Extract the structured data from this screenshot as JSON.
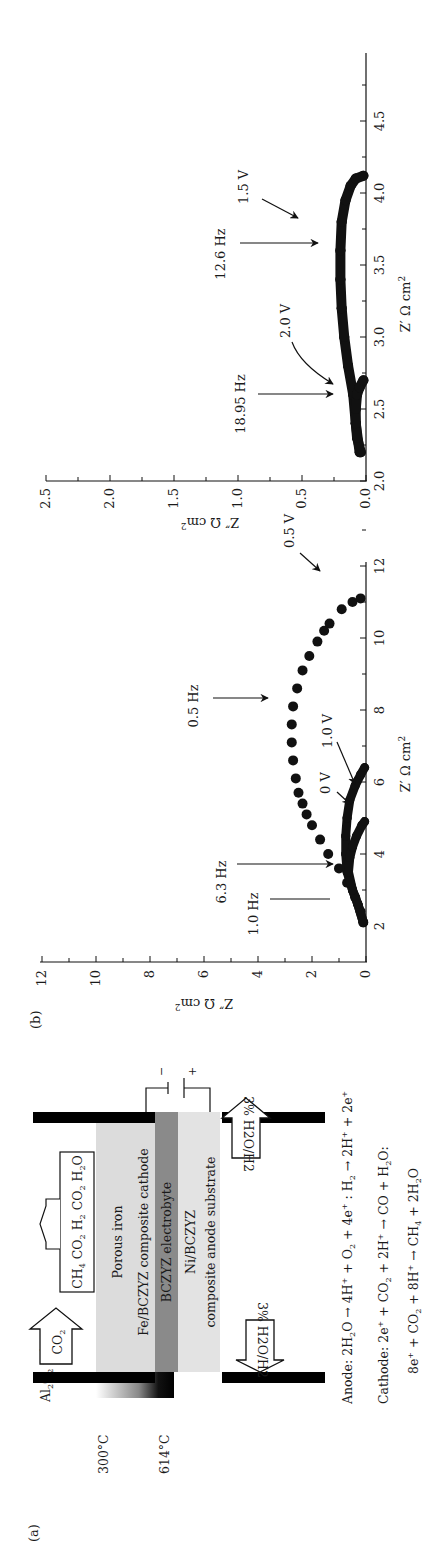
{
  "figure": {
    "panel_a": {
      "label": "(a)",
      "temperatures": {
        "low": "300°C",
        "high": "614°C"
      },
      "tube_label": "Al2O2 tube",
      "layers": {
        "cathode_line1": "Porous iron",
        "cathode_line2": "Fe/BCZYZ composite cathode",
        "electrolyte": "BCZYZ electrobyte",
        "anode_line1": "Ni/BCZYZ",
        "anode_line2": "composite anode substrate"
      },
      "gas_in_cathode": "CO2",
      "gas_out_cathode": "CH4 CO2 H2 CO2 H2O",
      "gas_in_anode": "3% H2O/H2",
      "gas_out_anode": "3% H2O/H2",
      "power_source": {
        "negative": "−",
        "positive": "+"
      },
      "equations": {
        "anode": "Anode: 2H2O → 4H+ + O2 + 4e+ : H2 → 2H+ + 2e+",
        "cathode_1": "Cathode: 2e+ + CO2 + 2H+ → CO + H2O:",
        "cathode_2": "8e+ + CO2 + 8H+ → CH4 + 2H2O"
      }
    },
    "panel_b": {
      "label": "(b)"
    }
  },
  "chart_data": [
    {
      "type": "scatter",
      "title": "(b) left — Nyquist plot, low voltages",
      "xlabel": "Z′ Ω cm²",
      "ylabel": "Z″ Ω cm²",
      "xlim": [
        1,
        13
      ],
      "ylim": [
        0,
        12
      ],
      "xticks": [
        "2",
        "4",
        "6",
        "8",
        "10",
        "12"
      ],
      "yticks": [
        "0",
        "2",
        "4",
        "6",
        "8",
        "10",
        "12"
      ],
      "grid": false,
      "annotations": [
        "0.5 Hz",
        "6.3 Hz",
        "1.0 Hz",
        "0.5 V",
        "1.0 V",
        "0 V"
      ],
      "series": [
        {
          "name": "0.5 V",
          "x": [
            2.1,
            2.4,
            2.8,
            3.2,
            3.6,
            4.0,
            4.4,
            4.8,
            5.1,
            5.4,
            5.7,
            6.1,
            6.6,
            7.1,
            7.6,
            8.1,
            8.6,
            9.1,
            9.5,
            9.9,
            10.2,
            10.4,
            10.8,
            11.0,
            11.1
          ],
          "y": [
            0.1,
            0.2,
            0.4,
            0.7,
            1.0,
            1.4,
            1.7,
            2.0,
            2.2,
            2.35,
            2.5,
            2.6,
            2.7,
            2.75,
            2.75,
            2.7,
            2.55,
            2.35,
            2.1,
            1.8,
            1.55,
            1.35,
            0.9,
            0.5,
            0.2
          ]
        },
        {
          "name": "1.0 V",
          "x": [
            2.1,
            2.6,
            3.0,
            3.5,
            4.0,
            4.5,
            5.0,
            5.5,
            5.9,
            6.2,
            6.4
          ],
          "y": [
            0.1,
            0.3,
            0.5,
            0.7,
            0.75,
            0.75,
            0.7,
            0.6,
            0.4,
            0.2,
            0.05
          ],
          "symbol": "triangle"
        },
        {
          "name": "0 V",
          "x": [
            2.1,
            2.6,
            3.0,
            3.5,
            3.9,
            4.2,
            4.5,
            4.8,
            4.9
          ],
          "y": [
            0.1,
            0.3,
            0.5,
            0.65,
            0.6,
            0.5,
            0.35,
            0.15,
            0.05
          ],
          "symbol": "triangle"
        }
      ]
    },
    {
      "type": "scatter",
      "title": "(b) right — Nyquist plot, high voltages",
      "xlabel": "Z′ Ω cm²",
      "ylabel": "Z″ Ω cm²",
      "xlim": [
        2.0,
        4.95
      ],
      "ylim": [
        0.0,
        2.5
      ],
      "xticks": [
        "2.0",
        "2.5",
        "3.0",
        "3.5",
        "4.0",
        "4.5"
      ],
      "yticks": [
        "0.0",
        "0.5",
        "1.0",
        "1.5",
        "2.0",
        "2.5"
      ],
      "grid": false,
      "annotations": [
        "12.6 Hz",
        "18.95 Hz",
        "1.5 V",
        "2.0 V"
      ],
      "series": [
        {
          "name": "1.5 V",
          "x": [
            2.2,
            2.4,
            2.6,
            2.8,
            3.0,
            3.2,
            3.4,
            3.6,
            3.8,
            3.95,
            4.05,
            4.1,
            4.12
          ],
          "y": [
            0.05,
            0.08,
            0.1,
            0.14,
            0.17,
            0.19,
            0.2,
            0.2,
            0.19,
            0.16,
            0.12,
            0.08,
            0.02
          ]
        },
        {
          "name": "2.0 V",
          "x": [
            2.2,
            2.3,
            2.4,
            2.5,
            2.6,
            2.65,
            2.7
          ],
          "y": [
            0.04,
            0.07,
            0.08,
            0.08,
            0.07,
            0.05,
            0.02
          ]
        }
      ]
    }
  ]
}
